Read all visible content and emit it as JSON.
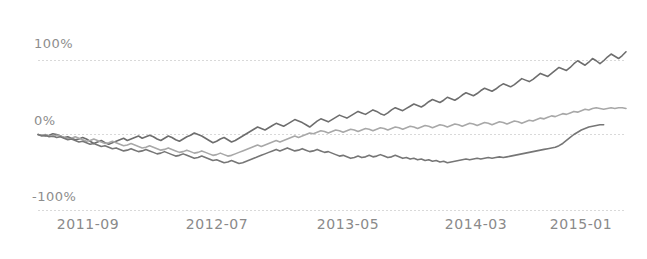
{
  "chart_data": {
    "type": "line",
    "title": "",
    "subtitle": "",
    "xlabel": "",
    "ylabel": "",
    "grid": true,
    "legend": "none",
    "background_color": "#ffffff",
    "ylim": [
      -100,
      150
    ],
    "y_ticks": [
      100,
      0,
      -100
    ],
    "y_tick_labels": [
      "100%",
      "0%",
      "-100%"
    ],
    "x_tick_labels": [
      "2011-09",
      "2012-07",
      "2013-05",
      "2014-03",
      "2015-01"
    ],
    "x_tick_positions_months": [
      0,
      10,
      20,
      30,
      40
    ],
    "x_range_months": [
      -1.5,
      44
    ],
    "series": [
      {
        "name": "series-1",
        "color": "#6e6e6e",
        "values": [
          0,
          -1,
          -2,
          -1,
          1,
          0,
          -2,
          -4,
          -3,
          -5,
          -7,
          -6,
          -4,
          -6,
          -9,
          -12,
          -10,
          -8,
          -11,
          -13,
          -11,
          -9,
          -7,
          -5,
          -8,
          -6,
          -4,
          -2,
          -5,
          -3,
          -1,
          -3,
          -6,
          -8,
          -5,
          -2,
          -4,
          -7,
          -9,
          -6,
          -3,
          -1,
          2,
          0,
          -2,
          -5,
          -8,
          -11,
          -9,
          -6,
          -4,
          -7,
          -10,
          -8,
          -5,
          -2,
          1,
          4,
          7,
          10,
          8,
          6,
          9,
          12,
          15,
          13,
          11,
          14,
          17,
          20,
          18,
          16,
          13,
          10,
          14,
          18,
          21,
          19,
          17,
          20,
          23,
          26,
          24,
          22,
          25,
          28,
          31,
          29,
          27,
          30,
          33,
          31,
          28,
          26,
          29,
          33,
          36,
          34,
          32,
          35,
          38,
          41,
          39,
          37,
          40,
          44,
          47,
          45,
          43,
          46,
          50,
          48,
          46,
          49,
          53,
          56,
          54,
          52,
          55,
          59,
          62,
          60,
          58,
          61,
          65,
          68,
          66,
          64,
          67,
          71,
          75,
          73,
          71,
          74,
          78,
          82,
          80,
          78,
          82,
          86,
          90,
          88,
          86,
          90,
          95,
          99,
          96,
          93,
          97,
          102,
          99,
          95,
          99,
          104,
          108,
          105,
          102,
          106,
          111
        ]
      },
      {
        "name": "series-2",
        "color": "#a8a8a8",
        "values": [
          0,
          -1,
          0,
          -2,
          -3,
          -1,
          -2,
          -4,
          -6,
          -5,
          -3,
          -5,
          -7,
          -9,
          -8,
          -6,
          -8,
          -10,
          -12,
          -11,
          -9,
          -11,
          -13,
          -15,
          -14,
          -12,
          -14,
          -16,
          -18,
          -17,
          -15,
          -17,
          -19,
          -21,
          -20,
          -18,
          -20,
          -22,
          -24,
          -23,
          -21,
          -23,
          -25,
          -24,
          -22,
          -24,
          -26,
          -28,
          -27,
          -25,
          -27,
          -29,
          -28,
          -26,
          -24,
          -22,
          -20,
          -18,
          -16,
          -14,
          -16,
          -14,
          -12,
          -10,
          -8,
          -10,
          -8,
          -6,
          -4,
          -2,
          -4,
          -2,
          0,
          2,
          1,
          3,
          5,
          4,
          2,
          4,
          6,
          5,
          3,
          5,
          7,
          6,
          4,
          6,
          8,
          7,
          5,
          7,
          9,
          8,
          6,
          8,
          10,
          9,
          7,
          9,
          11,
          10,
          8,
          10,
          12,
          11,
          9,
          11,
          13,
          12,
          10,
          12,
          14,
          13,
          11,
          13,
          15,
          14,
          12,
          14,
          16,
          15,
          13,
          15,
          17,
          16,
          14,
          16,
          18,
          17,
          15,
          17,
          19,
          18,
          20,
          22,
          21,
          23,
          25,
          24,
          26,
          28,
          27,
          29,
          31,
          30,
          32,
          34,
          33,
          35,
          36,
          35,
          34,
          35,
          36,
          35,
          36,
          36,
          35
        ]
      },
      {
        "name": "series-3",
        "color": "#767676",
        "values": [
          0,
          -2,
          -1,
          -3,
          -2,
          -4,
          -3,
          -5,
          -7,
          -6,
          -8,
          -10,
          -9,
          -11,
          -13,
          -12,
          -14,
          -16,
          -15,
          -17,
          -19,
          -18,
          -20,
          -22,
          -21,
          -19,
          -21,
          -23,
          -22,
          -20,
          -22,
          -24,
          -26,
          -25,
          -23,
          -25,
          -27,
          -29,
          -28,
          -26,
          -28,
          -30,
          -32,
          -31,
          -29,
          -31,
          -33,
          -35,
          -34,
          -36,
          -38,
          -37,
          -35,
          -37,
          -39,
          -38,
          -36,
          -34,
          -32,
          -30,
          -28,
          -26,
          -24,
          -22,
          -20,
          -22,
          -20,
          -18,
          -20,
          -22,
          -21,
          -19,
          -21,
          -23,
          -22,
          -20,
          -22,
          -24,
          -23,
          -25,
          -27,
          -29,
          -28,
          -30,
          -32,
          -31,
          -29,
          -31,
          -30,
          -28,
          -30,
          -29,
          -27,
          -29,
          -31,
          -30,
          -28,
          -30,
          -32,
          -31,
          -33,
          -32,
          -34,
          -33,
          -35,
          -34,
          -36,
          -35,
          -37,
          -36,
          -38,
          -37,
          -36,
          -35,
          -34,
          -33,
          -34,
          -33,
          -32,
          -33,
          -32,
          -31,
          -32,
          -31,
          -30,
          -31,
          -30,
          -29,
          -28,
          -27,
          -26,
          -25,
          -24,
          -23,
          -22,
          -21,
          -20,
          -19,
          -18,
          -17,
          -15,
          -12,
          -8,
          -4,
          0,
          3,
          6,
          8,
          10,
          11,
          12,
          13,
          13
        ]
      }
    ]
  },
  "axes": {
    "y_label_100": "100%",
    "y_label_0": "0%",
    "y_label_neg100": "-100%",
    "x_label_0": "2011-09",
    "x_label_1": "2012-07",
    "x_label_2": "2013-05",
    "x_label_3": "2014-03",
    "x_label_4": "2015-01"
  },
  "colors": {
    "gridline": "#d9d9d9",
    "tick_text": "#8a8a8a",
    "series_1": "#6e6e6e",
    "series_2": "#a8a8a8",
    "series_3": "#767676",
    "background": "#ffffff"
  }
}
